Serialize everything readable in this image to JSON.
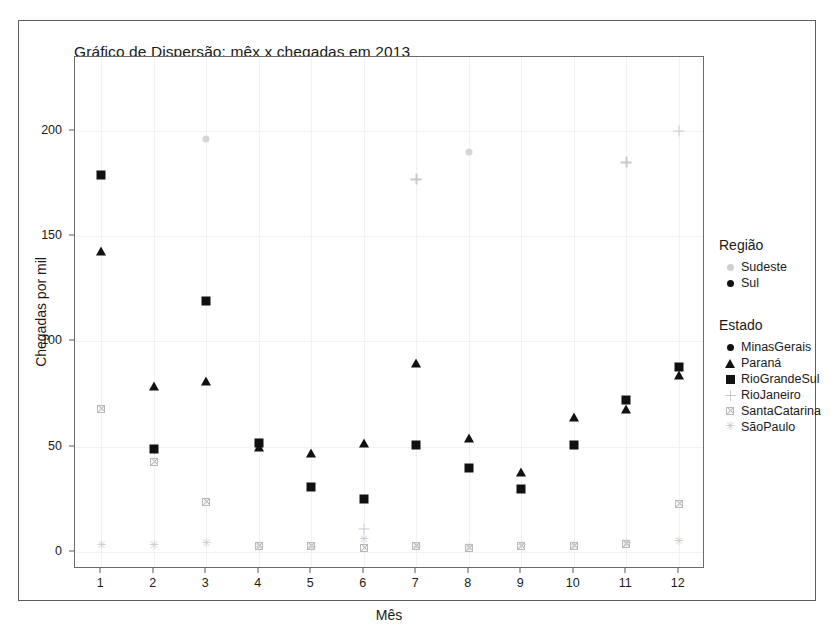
{
  "figure": {
    "title": "Gráfico de Dispersão: mêx x chegadas em 2013",
    "background": "#ffffff",
    "frame_color": "#5d5d5d"
  },
  "axes": {
    "x_title": "Mês",
    "y_title": "Chegadas por mil",
    "x_ticks": [
      "1",
      "2",
      "3",
      "4",
      "5",
      "6",
      "7",
      "8",
      "9",
      "10",
      "11",
      "12"
    ],
    "y_ticks": [
      "0",
      "50",
      "100",
      "150",
      "200"
    ]
  },
  "legend": {
    "region": {
      "title": "Região",
      "items": [
        {
          "label": "Sudeste",
          "marker": "circle-light",
          "color": "#cfcfcf"
        },
        {
          "label": "Sul",
          "marker": "circle-dark",
          "color": "#111111"
        }
      ]
    },
    "state": {
      "title": "Estado",
      "items": [
        {
          "label": "MinasGerais",
          "marker": "circle",
          "color": "#111111"
        },
        {
          "label": "Paraná",
          "marker": "triangle",
          "color": "#111111"
        },
        {
          "label": "RioGrandeSul",
          "marker": "square",
          "color": "#111111"
        },
        {
          "label": "RioJaneiro",
          "marker": "plus",
          "color": "#c9c9c9"
        },
        {
          "label": "SantaCatarina",
          "marker": "crossed-square",
          "color": "#b8b8b8"
        },
        {
          "label": "SãoPaulo",
          "marker": "asterisk",
          "color": "#cccccc"
        }
      ]
    }
  },
  "chart_data": {
    "type": "scatter",
    "title": "Gráfico de Dispersão: mêx x chegadas em 2013",
    "xlabel": "Mês",
    "ylabel": "Chegadas por mil",
    "xlim": [
      0.5,
      12.5
    ],
    "ylim": [
      -8,
      235
    ],
    "grid": true,
    "legend_position": "right",
    "x": [
      1,
      2,
      3,
      4,
      5,
      6,
      7,
      8,
      9,
      10,
      11,
      12
    ],
    "series": [
      {
        "name": "RioGrandeSul",
        "region": "Sul",
        "marker": "square",
        "color": "#111111",
        "points": [
          {
            "x": 1,
            "y": 179
          },
          {
            "x": 2,
            "y": 49
          },
          {
            "x": 3,
            "y": 119
          },
          {
            "x": 4,
            "y": 52
          },
          {
            "x": 5,
            "y": 31
          },
          {
            "x": 6,
            "y": 25
          },
          {
            "x": 7,
            "y": 51
          },
          {
            "x": 8,
            "y": 40
          },
          {
            "x": 9,
            "y": 30
          },
          {
            "x": 10,
            "y": 51
          },
          {
            "x": 11,
            "y": 72
          },
          {
            "x": 12,
            "y": 88
          }
        ]
      },
      {
        "name": "Paraná",
        "region": "Sul",
        "marker": "triangle",
        "color": "#111111",
        "points": [
          {
            "x": 1,
            "y": 143
          },
          {
            "x": 2,
            "y": 79
          },
          {
            "x": 3,
            "y": 81
          },
          {
            "x": 4,
            "y": 50
          },
          {
            "x": 5,
            "y": 47
          },
          {
            "x": 6,
            "y": 52
          },
          {
            "x": 7,
            "y": 90
          },
          {
            "x": 8,
            "y": 54
          },
          {
            "x": 9,
            "y": 38
          },
          {
            "x": 10,
            "y": 64
          },
          {
            "x": 11,
            "y": 68
          },
          {
            "x": 12,
            "y": 84
          }
        ]
      },
      {
        "name": "SantaCatarina",
        "region": "Sul",
        "marker": "crossed-square",
        "color": "#b8b8b8",
        "points": [
          {
            "x": 1,
            "y": 68
          },
          {
            "x": 2,
            "y": 43
          },
          {
            "x": 3,
            "y": 24
          },
          {
            "x": 4,
            "y": 3
          },
          {
            "x": 5,
            "y": 3
          },
          {
            "x": 6,
            "y": 2
          },
          {
            "x": 7,
            "y": 3
          },
          {
            "x": 8,
            "y": 2
          },
          {
            "x": 9,
            "y": 3
          },
          {
            "x": 10,
            "y": 3
          },
          {
            "x": 11,
            "y": 4
          },
          {
            "x": 12,
            "y": 23
          }
        ]
      },
      {
        "name": "SãoPaulo",
        "region": "Sudeste",
        "marker": "asterisk",
        "color": "#cccccc",
        "points": [
          {
            "x": 1,
            "y": 3
          },
          {
            "x": 2,
            "y": 3
          },
          {
            "x": 3,
            "y": 4
          },
          {
            "x": 4,
            "y": 2
          },
          {
            "x": 5,
            "y": 2
          },
          {
            "x": 6,
            "y": 6
          },
          {
            "x": 7,
            "y": 2
          },
          {
            "x": 8,
            "y": 2
          },
          {
            "x": 9,
            "y": 3
          },
          {
            "x": 10,
            "y": 3
          },
          {
            "x": 11,
            "y": 4
          },
          {
            "x": 12,
            "y": 5
          }
        ]
      },
      {
        "name": "RioJaneiro",
        "region": "Sudeste",
        "marker": "plus",
        "color": "#c9c9c9",
        "points": [
          {
            "x": 6,
            "y": 11
          },
          {
            "x": 7,
            "y": 177
          },
          {
            "x": 11,
            "y": 185
          },
          {
            "x": 12,
            "y": 200
          }
        ]
      },
      {
        "name": "MinasGerais",
        "region": "Sudeste",
        "marker": "circle",
        "color": "#d6d6d6",
        "points": [
          {
            "x": 3,
            "y": 196
          },
          {
            "x": 8,
            "y": 190
          }
        ]
      }
    ]
  }
}
